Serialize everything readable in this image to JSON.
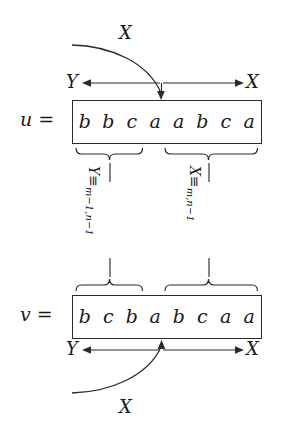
{
  "diagram": {
    "ink_color": "#2a2a2a",
    "background": "#ffffff",
    "rows": [
      {
        "name": "u",
        "label": "u =",
        "symbols": [
          "b",
          "b",
          "c",
          "a",
          "a",
          "b",
          "c",
          "a"
        ],
        "split_after_index": 3,
        "left_end_label": "Y",
        "right_end_label": "X",
        "curve_label": "X",
        "curve_side": "top"
      },
      {
        "name": "v",
        "label": "v =",
        "symbols": [
          "b",
          "c",
          "b",
          "a",
          "b",
          "c",
          "a",
          "a"
        ],
        "split_after_index": 3,
        "left_end_label": "Y",
        "right_end_label": "X",
        "curve_label": "X",
        "curve_side": "bottom"
      }
    ],
    "congruences": [
      {
        "name": "left-congruence",
        "symbol": "Y",
        "relation": "≡",
        "subscript": "m−1,n−1",
        "full": "Y ≡ m−1,n−1"
      },
      {
        "name": "right-congruence",
        "symbol": "X",
        "relation": "≡",
        "subscript": "m,n−1",
        "full": "X ≡ m,n−1"
      }
    ],
    "braces": [
      {
        "name": "u-left-brace",
        "covers": "u[1..3]"
      },
      {
        "name": "u-right-brace",
        "covers": "u[4..8]"
      },
      {
        "name": "v-left-brace",
        "covers": "v[1..3]"
      },
      {
        "name": "v-right-brace",
        "covers": "v[4..8]"
      }
    ]
  }
}
